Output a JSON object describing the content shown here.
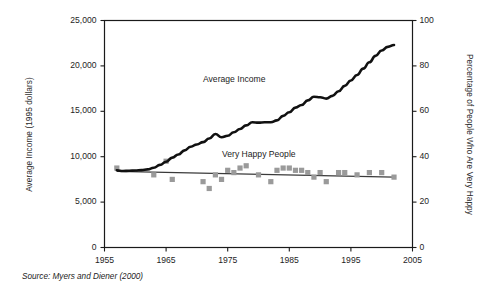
{
  "figure": {
    "source_note": "Source: Myers and Diener (2000)",
    "labels": {
      "income_series": "Average Income",
      "happy_series": "Very Happy People"
    }
  },
  "chart_data": {
    "type": "line",
    "title": "",
    "subtitle": "",
    "xlabel": "",
    "ylabel": "Average Income (1995 dollars)",
    "y2label": "Percentage of People Who Are Very Happy",
    "xlim": [
      1955,
      2005
    ],
    "ylim": [
      0,
      25000
    ],
    "y2lim": [
      0,
      100
    ],
    "xticks": [
      1955,
      1965,
      1975,
      1985,
      1995,
      2005
    ],
    "xticklabels": [
      "1955",
      "1965",
      "1975",
      "1985",
      "1995",
      "2005"
    ],
    "yticks": [
      0,
      5000,
      10000,
      15000,
      20000,
      25000
    ],
    "yticklabels": [
      "0",
      "5,000",
      "10,000",
      "15,000",
      "20,000",
      "25,000"
    ],
    "y2ticks": [
      0,
      20,
      40,
      60,
      80,
      100
    ],
    "y2ticklabels": [
      "0",
      "20",
      "40",
      "60",
      "80",
      "100"
    ],
    "grid": false,
    "legend": "inline-annotations",
    "colors": {
      "income_line": "#111111",
      "happy_trend_line": "#3a3a3a",
      "happy_markers": "#9a9a9a",
      "axis": "#1a1a1a",
      "background": "#ffffff"
    },
    "series": [
      {
        "name": "Average Income",
        "type": "line",
        "axis": "left",
        "units": "1995 dollars",
        "x": [
          1957,
          1958,
          1959,
          1960,
          1961,
          1962,
          1963,
          1964,
          1965,
          1966,
          1967,
          1968,
          1969,
          1970,
          1971,
          1972,
          1973,
          1974,
          1975,
          1976,
          1977,
          1978,
          1979,
          1980,
          1981,
          1982,
          1983,
          1984,
          1985,
          1986,
          1987,
          1988,
          1989,
          1990,
          1991,
          1992,
          1993,
          1994,
          1995,
          1996,
          1997,
          1998,
          1999,
          2000,
          2001,
          2002
        ],
        "y": [
          8500,
          8420,
          8450,
          8480,
          8520,
          8600,
          8780,
          9100,
          9450,
          9900,
          10250,
          10700,
          11100,
          11350,
          11600,
          12000,
          12500,
          12150,
          12300,
          12700,
          13050,
          13450,
          13800,
          13750,
          13800,
          13800,
          14000,
          14500,
          14900,
          15400,
          15700,
          16200,
          16600,
          16550,
          16400,
          16700,
          17200,
          17800,
          18400,
          19000,
          19700,
          20400,
          21100,
          21700,
          22100,
          22300
        ]
      },
      {
        "name": "Very Happy People",
        "type": "scatter",
        "axis": "right",
        "units": "percent",
        "x": [
          1957,
          1963,
          1965,
          1966,
          1971,
          1972,
          1973,
          1974,
          1975,
          1976,
          1977,
          1978,
          1980,
          1982,
          1983,
          1984,
          1985,
          1986,
          1987,
          1988,
          1989,
          1990,
          1991,
          1993,
          1994,
          1996,
          1998,
          2000,
          2002
        ],
        "y": [
          35,
          32,
          38,
          30,
          29,
          26,
          32,
          30,
          34,
          33,
          35,
          36,
          32,
          29,
          34,
          35,
          35,
          34,
          34,
          33,
          31,
          33,
          29,
          33,
          33,
          32,
          33,
          33,
          31
        ]
      },
      {
        "name": "Very Happy People trend",
        "type": "line",
        "axis": "right",
        "x": [
          1957,
          2002
        ],
        "y": [
          33.5,
          31.0
        ]
      }
    ]
  }
}
